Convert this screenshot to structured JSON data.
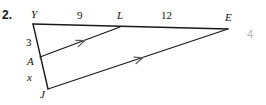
{
  "problem": {
    "number": "2."
  },
  "page": {
    "number": "4"
  },
  "figure": {
    "type": "triangle-with-parallel-segments",
    "vertices": [
      {
        "name": "Y",
        "label": "Y",
        "x": 33,
        "y": 24
      },
      {
        "name": "L",
        "label": "L",
        "x": 120,
        "y": 27
      },
      {
        "name": "E",
        "label": "E",
        "x": 228,
        "y": 29
      },
      {
        "name": "A",
        "label": "A",
        "x": 40,
        "y": 57
      },
      {
        "name": "J",
        "label": "J",
        "x": 48,
        "y": 89
      }
    ],
    "segments": [
      {
        "name": "YE",
        "from": "Y",
        "to": "E",
        "kind": "side"
      },
      {
        "name": "YJ",
        "from": "Y",
        "to": "J",
        "kind": "side"
      },
      {
        "name": "JE",
        "from": "J",
        "to": "E",
        "kind": "parallel",
        "marks": 1
      },
      {
        "name": "AL",
        "from": "A",
        "to": "L",
        "kind": "parallel",
        "marks": 1
      }
    ],
    "measures": [
      {
        "name": "YL",
        "label": "9",
        "on": "YE"
      },
      {
        "name": "LE",
        "label": "12",
        "on": "YE"
      },
      {
        "name": "YA",
        "label": "3",
        "on": "YJ"
      },
      {
        "name": "AJ",
        "label": "x",
        "on": "YJ"
      }
    ],
    "colors": {
      "stroke": "#1a1a1a",
      "text": "#111111",
      "page_number": "#b4b4b4",
      "background": "#ffffff"
    }
  }
}
